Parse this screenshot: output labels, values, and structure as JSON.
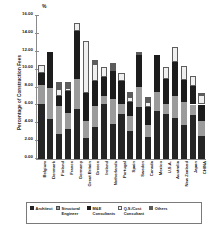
{
  "chart_data": {
    "type": "bar",
    "stacked": true,
    "title": "",
    "unit_symbol": "%",
    "xlabel": "",
    "ylabel": "Percentage of Construction Fees",
    "ylim": [
      0.0,
      16.0
    ],
    "ytick_labels": [
      "16.00",
      "14.00",
      "12.00",
      "10.00",
      "8.00",
      "6.00",
      "4.00",
      "2.00",
      "0.00"
    ],
    "ytick_values": [
      16.0,
      14.0,
      12.0,
      10.0,
      8.0,
      6.0,
      4.0,
      2.0,
      0.0
    ],
    "grid": false,
    "legend_position": "bottom",
    "categories": [
      "Belgium",
      "Denmark",
      "Finland",
      "France",
      "Germany",
      "Great Britain",
      "Greece",
      "Ireland",
      "Netherlands",
      "Portugal",
      "Spain",
      "Sweden",
      "Canada",
      "Mexico",
      "U.S.A.",
      "Australia",
      "New Zealand",
      "Japan",
      "CHINA"
    ],
    "series": [
      {
        "name": "Architect",
        "color": "#252525",
        "values": [
          6.2,
          4.5,
          2.8,
          3.4,
          5.6,
          2.3,
          3.6,
          6.1,
          3.9,
          5.0,
          3.1,
          5.8,
          2.5,
          5.4,
          5.0,
          4.6,
          3.8,
          4.9,
          2.6
        ]
      },
      {
        "name": "Structural Engineer",
        "color": "#9b9b9b",
        "values": [
          2.1,
          3.5,
          3.1,
          1.8,
          3.4,
          2.0,
          2.3,
          0.9,
          2.8,
          1.1,
          1.7,
          2.3,
          1.3,
          2.1,
          1.1,
          2.5,
          2.6,
          1.2,
          1.6
        ]
      },
      {
        "name": "M&E Consultants",
        "color": "#1c1c1c",
        "values": [
          1.3,
          4.0,
          1.2,
          2.4,
          5.3,
          3.1,
          2.8,
          2.2,
          3.2,
          2.6,
          1.6,
          3.5,
          2.0,
          4.1,
          2.8,
          3.7,
          2.4,
          2.1,
          1.9
        ]
      },
      {
        "name": "Q.S./Cost Consultant",
        "color": "#efefef",
        "values": [
          0.9,
          0.0,
          0.7,
          0.4,
          0.9,
          5.8,
          1.9,
          1.1,
          0.0,
          0.9,
          0.5,
          0.0,
          0.6,
          0.0,
          1.4,
          1.7,
          1.6,
          1.1,
          1.1
        ]
      },
      {
        "name": "Others",
        "color": "#5c5c5c",
        "values": [
          0.0,
          0.0,
          0.8,
          0.6,
          0.0,
          0.0,
          0.5,
          0.0,
          0.8,
          0.0,
          0.6,
          0.4,
          0.5,
          0.0,
          0.0,
          0.0,
          0.0,
          0.0,
          0.2
        ]
      }
    ],
    "totals": [
      10.5,
      12.0,
      8.6,
      8.6,
      15.2,
      13.2,
      11.1,
      10.3,
      10.7,
      9.6,
      7.5,
      12.0,
      6.9,
      11.6,
      10.3,
      12.5,
      10.4,
      9.3,
      7.4
    ]
  },
  "legend": {
    "items": [
      {
        "label": "Architect",
        "swatch": "architect"
      },
      {
        "label": "Structural Engineer",
        "swatch": "structural"
      },
      {
        "label": "M&E Consultants",
        "swatch": "me"
      },
      {
        "label": "Q.S./Cost Consultant",
        "swatch": "qs"
      },
      {
        "label": "Others",
        "swatch": "others"
      }
    ]
  }
}
